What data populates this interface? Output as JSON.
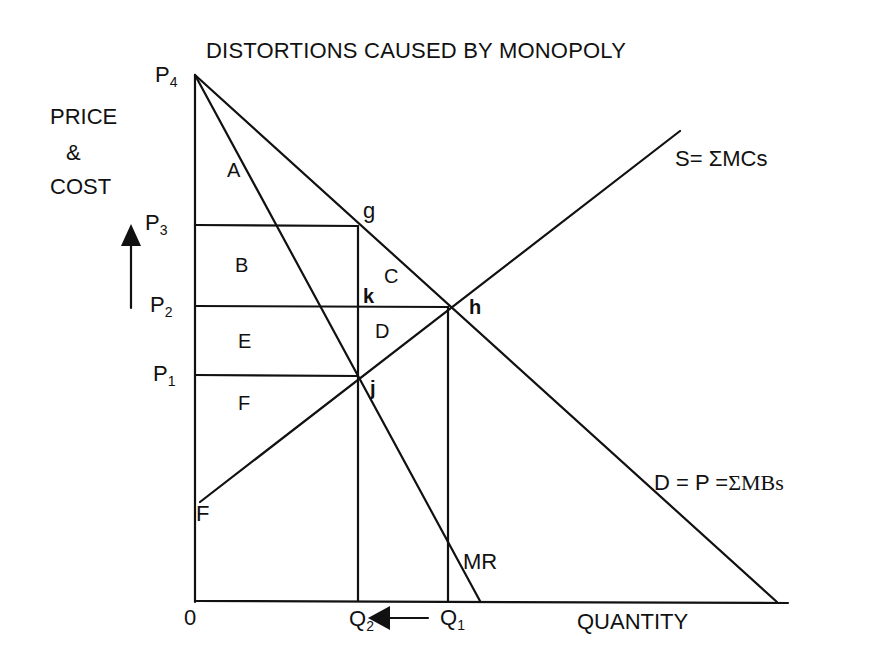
{
  "title": "DISTORTIONS CAUSED BY MONOPOLY",
  "axes": {
    "y_label_line1": "PRICE",
    "y_label_line2": "&",
    "y_label_line3": "COST",
    "x_label": "QUANTITY",
    "origin": "0"
  },
  "price_ticks": [
    {
      "base": "P",
      "sub": "4"
    },
    {
      "base": "P",
      "sub": "3"
    },
    {
      "base": "P",
      "sub": "2"
    },
    {
      "base": "P",
      "sub": "1"
    }
  ],
  "quantity_ticks": [
    {
      "base": "Q",
      "sub": "2"
    },
    {
      "base": "Q",
      "sub": "1"
    }
  ],
  "regions": [
    "A",
    "B",
    "C",
    "D",
    "E",
    "F"
  ],
  "points": {
    "g": "g",
    "h": "h",
    "j": "j",
    "k": "k",
    "F": "F"
  },
  "curves": {
    "supply": "S= ΣMCs",
    "demand_prefix": "D = P =",
    "demand_suffix": "ΣMBs",
    "mr": "MR"
  },
  "colors": {
    "line": "#111111",
    "background": "#ffffff"
  }
}
